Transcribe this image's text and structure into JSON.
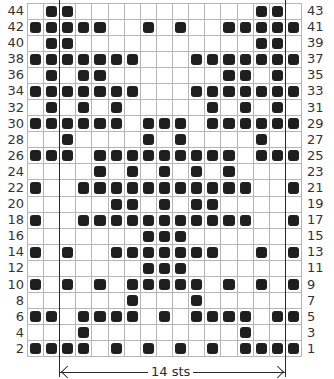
{
  "chart_data": {
    "type": "table",
    "columns": 17,
    "rows": 22,
    "repeat": {
      "label": "14 sts",
      "start_col": 3,
      "end_col": 16
    },
    "left_labels": [
      "44",
      "42",
      "40",
      "38",
      "36",
      "34",
      "32",
      "30",
      "28",
      "26",
      "24",
      "22",
      "20",
      "18",
      "16",
      "14",
      "12",
      "10",
      "8",
      "6",
      "4",
      "2"
    ],
    "right_labels": [
      "43",
      "41",
      "39",
      "37",
      "35",
      "33",
      "31",
      "29",
      "27",
      "25",
      "23",
      "21",
      "19",
      "17",
      "15",
      "13",
      "11",
      "9",
      "7",
      "5",
      "3",
      "1"
    ],
    "filled_cells_by_row_top_to_bottom": [
      [
        2,
        3,
        15,
        16
      ],
      [
        1,
        2,
        3,
        4,
        5,
        8,
        10,
        13,
        14,
        15,
        16,
        17
      ],
      [
        2,
        3,
        15,
        16
      ],
      [
        1,
        2,
        3,
        4,
        5,
        6,
        7,
        11,
        12,
        13,
        14,
        15,
        16,
        17
      ],
      [
        2,
        4,
        5,
        13,
        14,
        16
      ],
      [
        1,
        2,
        3,
        4,
        5,
        6,
        7,
        11,
        12,
        13,
        14,
        15,
        16,
        17
      ],
      [
        2,
        4,
        6,
        12,
        14,
        16
      ],
      [
        1,
        2,
        3,
        4,
        5,
        6,
        8,
        9,
        10,
        12,
        13,
        14,
        15,
        16,
        17
      ],
      [
        3,
        8,
        10,
        15
      ],
      [
        1,
        2,
        3,
        5,
        6,
        7,
        8,
        9,
        10,
        11,
        12,
        13,
        15,
        16,
        17
      ],
      [
        5,
        7,
        9,
        11,
        13
      ],
      [
        1,
        4,
        5,
        6,
        7,
        8,
        9,
        10,
        11,
        12,
        13,
        14,
        17
      ],
      [
        6,
        7,
        9,
        11,
        12
      ],
      [
        1,
        4,
        5,
        6,
        7,
        8,
        9,
        10,
        11,
        12,
        13,
        14,
        17
      ],
      [
        8,
        9,
        10
      ],
      [
        1,
        3,
        6,
        7,
        8,
        9,
        10,
        11,
        12,
        15,
        17
      ],
      [
        8,
        9,
        10
      ],
      [
        1,
        3,
        5,
        7,
        8,
        9,
        10,
        11,
        13,
        15,
        17
      ],
      [
        7,
        11
      ],
      [
        1,
        2,
        4,
        5,
        6,
        7,
        9,
        11,
        12,
        13,
        14,
        16,
        17
      ],
      [
        4,
        14
      ],
      [
        1,
        2,
        3,
        4,
        6,
        8,
        10,
        12,
        14,
        15,
        16,
        17
      ]
    ],
    "colors": {
      "filled": "#1f1f1f",
      "empty": "#ffffff",
      "grid": "#b5b5b5"
    }
  }
}
